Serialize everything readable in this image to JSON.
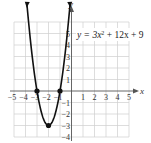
{
  "chart_data": {
    "type": "line",
    "title": "",
    "equation": "y = 3x² + 12x + 9",
    "xlabel": "x",
    "ylabel": "y",
    "xlim": [
      -5,
      5
    ],
    "ylim": [
      -4,
      6
    ],
    "grid": true,
    "x_ticks": [
      -5,
      -4,
      -3,
      -2,
      -1,
      1,
      2,
      3,
      4,
      5
    ],
    "y_ticks": [
      -4,
      -3,
      -2,
      -1,
      1,
      2,
      3,
      4,
      5
    ],
    "series": [
      {
        "name": "y = 3x^2 + 12x + 9",
        "function": "3x^2+12x+9",
        "domain": [
          -3.87,
          -0.13
        ],
        "arrows_at_ends": true
      }
    ],
    "points": [
      {
        "label": "x-intercept",
        "x": -3,
        "y": 0
      },
      {
        "label": "x-intercept",
        "x": -1,
        "y": 0
      },
      {
        "label": "vertex",
        "x": -2,
        "y": -3
      }
    ]
  },
  "labels": {
    "x_axis": "x",
    "y_axis": "y",
    "equation_prefix": "y = 3x",
    "equation_exp": "2",
    "equation_suffix": " + 12x + 9",
    "xt": [
      "−5",
      "−4",
      "−3",
      "−2",
      "−1",
      "1",
      "2",
      "3",
      "4",
      "5"
    ],
    "yt": [
      "−4",
      "−3",
      "−2",
      "−1",
      "1",
      "2",
      "3",
      "4",
      "5"
    ]
  }
}
